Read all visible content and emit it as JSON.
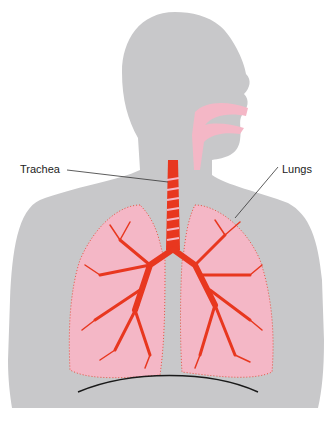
{
  "diagram": {
    "labels": {
      "trachea": "Trachea",
      "lungs": "Lungs"
    },
    "colors": {
      "silhouette": "#c8c8ca",
      "airway_pink": "#f4b7c6",
      "bronchi_red": "#e8371f",
      "diaphragm": "#1a1a1a",
      "leader_line": "#333333"
    }
  }
}
